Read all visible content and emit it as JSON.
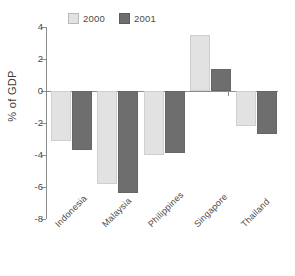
{
  "chart_data": {
    "type": "bar",
    "title": "",
    "subtitle": "",
    "xlabel": "",
    "ylabel": "% of GDP",
    "categories": [
      "Indonesia",
      "Malaysia",
      "Philippines",
      "Singapore",
      "Thailand"
    ],
    "series": [
      {
        "name": "2000",
        "color": "#e2e2e2",
        "values": [
          -3.1,
          -5.8,
          -4.0,
          3.5,
          -2.2
        ]
      },
      {
        "name": "2001",
        "color": "#6e6e6e",
        "values": [
          -3.7,
          -6.4,
          -3.9,
          1.4,
          -2.7
        ]
      }
    ],
    "ylim": [
      -8,
      4
    ],
    "yticks": [
      4,
      2,
      0,
      -2,
      -4,
      -6,
      -8
    ],
    "ytick_labels": [
      "4",
      "2",
      "0",
      "-2",
      "-4",
      "-6",
      "-8"
    ],
    "grid": false,
    "legend_position": "top",
    "zero_line": 0,
    "orientation": "vertical",
    "category_label_rotation": -45
  },
  "legend": {
    "entries": [
      {
        "label": "2000",
        "color": "#e2e2e2"
      },
      {
        "label": "2001",
        "color": "#6e6e6e"
      }
    ]
  },
  "axis": {
    "y_title": "% of GDP"
  },
  "colors": {
    "series_2000": "#e2e2e2",
    "series_2001": "#6e6e6e",
    "axis": "#8c8c8c",
    "text": "#4a4a4a",
    "background": "#ffffff"
  }
}
